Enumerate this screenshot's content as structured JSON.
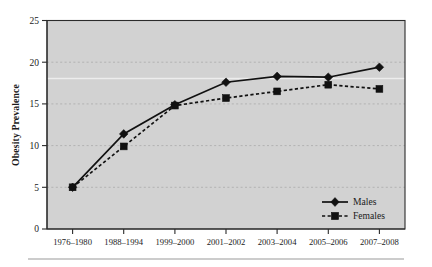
{
  "chart_data": {
    "type": "line",
    "title": "",
    "xlabel": "",
    "ylabel": "Obesity Prevalence",
    "categories": [
      "1976–1980",
      "1988–1994",
      "1999–2000",
      "2001–2002",
      "2003–2004",
      "2005–2006",
      "2007–2008"
    ],
    "series": [
      {
        "name": "Males",
        "values": [
          5.0,
          11.4,
          14.9,
          17.6,
          18.3,
          18.2,
          19.4
        ],
        "marker": "diamond",
        "line_style": "solid",
        "color": "#111111"
      },
      {
        "name": "Females",
        "values": [
          5.0,
          9.9,
          14.8,
          15.7,
          16.5,
          17.3,
          16.8
        ],
        "marker": "square",
        "line_style": "dashed",
        "color": "#111111"
      }
    ],
    "ylim": [
      0,
      25
    ],
    "yticks": [
      0,
      5,
      10,
      15,
      20,
      25
    ],
    "ytick_labels": [
      "0",
      "5",
      "10",
      "15",
      "20",
      "25"
    ],
    "grid": true,
    "grid_axis": "y",
    "legend_position": "bottom-right",
    "plot_background": "#d2d2d2",
    "page_background": "#ffffff"
  },
  "axes": {
    "y_title": "Obesity Prevalence",
    "y_tick_labels": [
      "25",
      "20",
      "15",
      "10",
      "5",
      "0"
    ],
    "x_tick_labels": [
      "1976–1980",
      "1988–1994",
      "1999–2000",
      "2001–2002",
      "2003–2004",
      "2005–2006",
      "2007–2008"
    ]
  },
  "legend": {
    "entries": [
      {
        "label": "Males",
        "marker": "diamond-marker",
        "style": "solid"
      },
      {
        "label": "Females",
        "marker": "square-marker",
        "style": "dashed"
      }
    ]
  }
}
